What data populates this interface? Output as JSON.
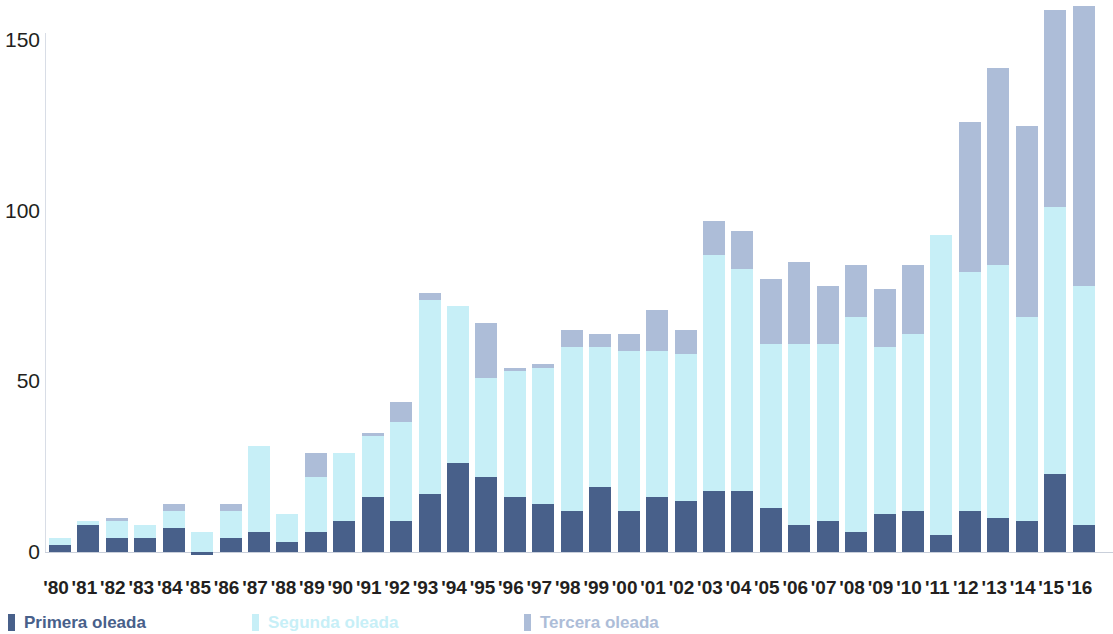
{
  "chart_data": {
    "type": "bar",
    "title": "",
    "subtitle": "",
    "xlabel": "",
    "ylabel": "",
    "stacked": true,
    "grid": false,
    "legend_position": "bottom-left",
    "ylim": [
      0,
      160
    ],
    "yticks": [
      0,
      50,
      100,
      150
    ],
    "ytick_labels": [
      "0",
      "50",
      "100",
      "150"
    ],
    "categories": [
      "'80",
      "'81",
      "'82",
      "'83",
      "'84",
      "'85",
      "'86",
      "'87",
      "'88",
      "'89",
      "'90",
      "'91",
      "'92",
      "'93",
      "'94",
      "'95",
      "'96",
      "'97",
      "'98",
      "'99",
      "'00",
      "'01",
      "'02",
      "'03",
      "'04",
      "'05",
      "'06",
      "'07",
      "'08",
      "'09",
      "'10",
      "'11",
      "'12",
      "'13",
      "'14",
      "'15",
      "'16"
    ],
    "series": [
      {
        "name": "Primera oleada",
        "color": "#48608a",
        "values": [
          2,
          8,
          4,
          4,
          7,
          -1,
          4,
          6,
          3,
          6,
          9,
          16,
          9,
          17,
          26,
          22,
          16,
          14,
          12,
          19,
          12,
          16,
          15,
          18,
          18,
          13,
          8,
          9,
          6,
          11,
          12,
          5,
          12,
          10,
          9,
          23,
          8
        ]
      },
      {
        "name": "Segunda oleada",
        "color": "#c7eff7",
        "values": [
          2,
          1,
          5,
          4,
          5,
          6,
          8,
          25,
          8,
          16,
          20,
          18,
          29,
          57,
          46,
          29,
          37,
          40,
          48,
          41,
          47,
          43,
          43,
          69,
          65,
          48,
          53,
          52,
          63,
          49,
          52,
          88,
          70,
          74,
          60,
          78,
          70
        ]
      },
      {
        "name": "Tercera oleada",
        "color": "#adbdd8",
        "values": [
          0,
          0,
          1,
          0,
          2,
          0,
          2,
          0,
          0,
          7,
          0,
          1,
          6,
          2,
          0,
          16,
          1,
          1,
          5,
          4,
          5,
          12,
          7,
          10,
          11,
          19,
          24,
          17,
          15,
          17,
          20,
          0,
          44,
          58,
          56,
          58,
          82
        ]
      }
    ]
  },
  "legend": {
    "items": [
      {
        "label": "Primera oleada",
        "color": "#48608a",
        "swatch_name": "legend-swatch-primera"
      },
      {
        "label": "Segunda oleada",
        "color": "#c7eff7",
        "swatch_name": "legend-swatch-segunda"
      },
      {
        "label": "Tercera oleada",
        "color": "#adbdd8",
        "swatch_name": "legend-swatch-tercera"
      }
    ]
  }
}
